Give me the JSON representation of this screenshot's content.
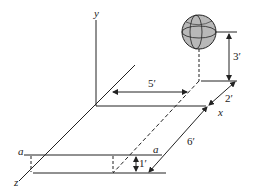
{
  "diagram": {
    "axes": {
      "x_label": "x",
      "y_label": "y",
      "z_label": "z"
    },
    "dimensions": {
      "ball_height": "3′",
      "x_offset": "5′",
      "z_offset_near": "2′",
      "z_offset_far": "6′",
      "step_height": "1′"
    },
    "section_labels": {
      "left": "a",
      "right": "a"
    },
    "colors": {
      "line": "#222222",
      "ball_fill": "#b8b8b8"
    }
  }
}
